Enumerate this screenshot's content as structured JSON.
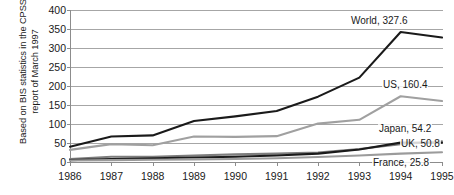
{
  "chart_data": {
    "type": "line",
    "title": "",
    "subtitle": "",
    "xlabel": "",
    "ylabel": "Based on BIS statistics in the CPSS\nreport of March 1997",
    "categories": [
      "1986",
      "1987",
      "1988",
      "1989",
      "1990",
      "1991",
      "1992",
      "1993",
      "1994",
      "1995"
    ],
    "ylim": [
      0,
      400
    ],
    "yticks": [
      0,
      50,
      100,
      150,
      200,
      250,
      300,
      350,
      400
    ],
    "grid": true,
    "legend_position": "end-of-line-labels",
    "series": [
      {
        "name": "World",
        "color": "#1a1a1a",
        "end_label": "World, 327.6",
        "end_value": 327.6,
        "values": [
          40,
          67,
          70,
          108,
          120,
          134,
          172,
          222,
          342,
          327.6
        ]
      },
      {
        "name": "US",
        "color": "#a0a0a0",
        "end_label": "US, 160.4",
        "end_value": 160.4,
        "values": [
          32,
          47,
          44,
          67,
          66,
          68,
          101,
          111,
          173,
          160.4
        ]
      },
      {
        "name": "Japan",
        "color": "#7d7d7d",
        "end_label": "Japan, 54.2",
        "end_value": 54.2,
        "values": [
          8,
          14,
          14,
          17,
          20,
          22,
          25,
          34,
          47,
          54.2
        ]
      },
      {
        "name": "UK",
        "color": "#1a1a1a",
        "end_label": "UK, 50.8",
        "end_value": 50.8,
        "values": [
          5,
          8,
          10,
          12,
          14,
          17,
          22,
          33,
          51,
          50.8
        ]
      },
      {
        "name": "France",
        "color": "#9b9b9b",
        "end_label": "France, 25.8",
        "end_value": 25.8,
        "values": [
          4,
          5,
          6,
          7,
          8,
          10,
          13,
          17,
          22,
          25.8
        ]
      }
    ]
  }
}
